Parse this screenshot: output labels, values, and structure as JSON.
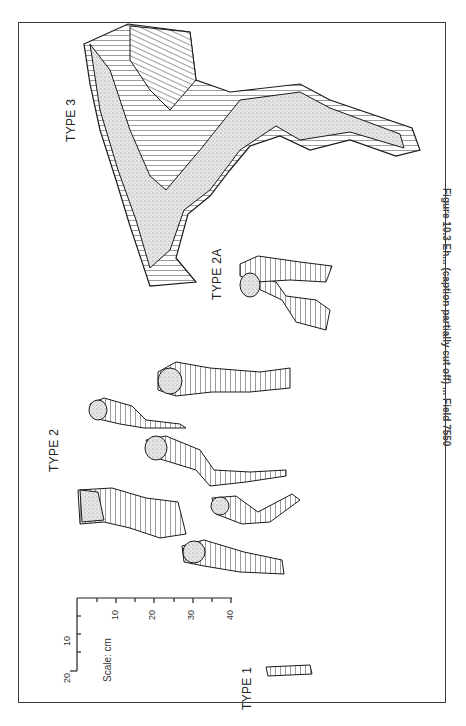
{
  "figure": {
    "caption": "Figure 10.3   Eh... (caption partially cut off) ... Field 7550",
    "orientation": "rotated 90 degrees",
    "specimen_labels": {
      "type1": "TYPE 1",
      "type2": "TYPE 2",
      "type2a": "TYPE 2A",
      "type3": "TYPE 3"
    },
    "scale": {
      "label": "Scale: cm",
      "horizontal_ticks": [
        "10",
        "20",
        "30",
        "40"
      ],
      "vertical_ticks": [
        "10",
        "20"
      ]
    },
    "colors": {
      "ink": "#1a1a1a",
      "stipple": "#9a9a9a",
      "frame": "#3a3a3a",
      "background": "#ffffff"
    }
  }
}
